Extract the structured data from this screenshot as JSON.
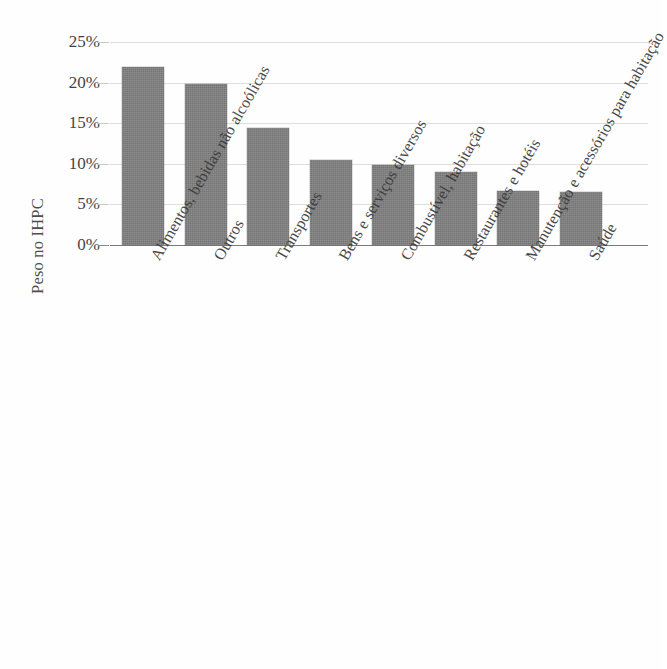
{
  "chart_data": {
    "type": "bar",
    "title": "",
    "subtitle": "",
    "xlabel": "",
    "ylabel": "Peso no IHPC",
    "ylim": [
      0,
      25
    ],
    "ytick_labels": [
      "25%",
      "20%",
      "15%",
      "10%",
      "5%",
      "0%"
    ],
    "ytick_values": [
      25,
      20,
      15,
      10,
      5,
      0
    ],
    "grid": true,
    "legend": "none",
    "value_unit": "%",
    "categories": [
      "Alimentos, bebidas não alcoólicas",
      "Outros",
      "Transportes",
      "Bens e serviços diversos",
      "Combustível, habitação",
      "Restaurantes e hotéis",
      "Manutenção e acessórios para habitação",
      "Saúde"
    ],
    "values": [
      21.9,
      19.8,
      14.4,
      10.5,
      9.8,
      9.0,
      6.6,
      6.5
    ],
    "bar_color": "#808080",
    "gridline_color": "#d8d8d8",
    "axis_color": "#7a7a7a",
    "background_color": "#fefefe"
  }
}
